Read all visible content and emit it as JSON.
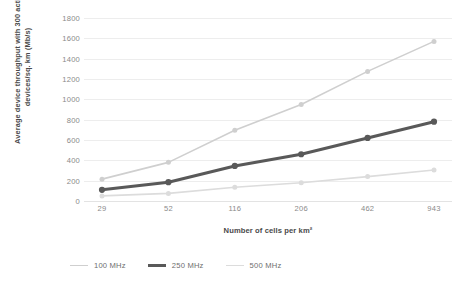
{
  "chart_data": {
    "type": "line",
    "title": "",
    "xlabel": "Number of cells per km²",
    "ylabel": "Average device throughput with 300 active devices/sq. km (Mb/s)",
    "categories": [
      "29",
      "52",
      "116",
      "206",
      "462",
      "943"
    ],
    "ylim": [
      0,
      1800
    ],
    "ytick_values": [
      0,
      200,
      400,
      600,
      800,
      1000,
      1200,
      1400,
      1600,
      1800
    ],
    "ytick_labels": [
      "0",
      "200",
      "400",
      "600",
      "800",
      "1000",
      "1200",
      "1400",
      "1600",
      "1800"
    ],
    "grid": true,
    "legend_position": "bottom",
    "series": [
      {
        "name": "100 MHz",
        "color": "#cfcfcf",
        "width": 1.6,
        "marker": "circle",
        "values": [
          215,
          380,
          695,
          950,
          1275,
          1570
        ]
      },
      {
        "name": "250 MHz",
        "color": "#595959",
        "width": 3.0,
        "marker": "circle",
        "values": [
          110,
          185,
          345,
          460,
          620,
          780
        ]
      },
      {
        "name": "500 MHz",
        "color": "#dcdcdc",
        "width": 1.6,
        "marker": "circle",
        "values": [
          50,
          75,
          135,
          180,
          240,
          305
        ]
      }
    ]
  },
  "legend": {
    "items": [
      {
        "label": "100 MHz",
        "color": "#cfcfcf",
        "width": 1.6
      },
      {
        "label": "250 MHz",
        "color": "#595959",
        "width": 3.0
      },
      {
        "label": "500 MHz",
        "color": "#dcdcdc",
        "width": 1.6
      }
    ]
  },
  "colors": {
    "background": "#ffffff",
    "gridline": "#ededed",
    "baseline": "#e3e3e3",
    "tick_text": "#8a8a8a",
    "axis_title_text": "#4a4a4a"
  }
}
